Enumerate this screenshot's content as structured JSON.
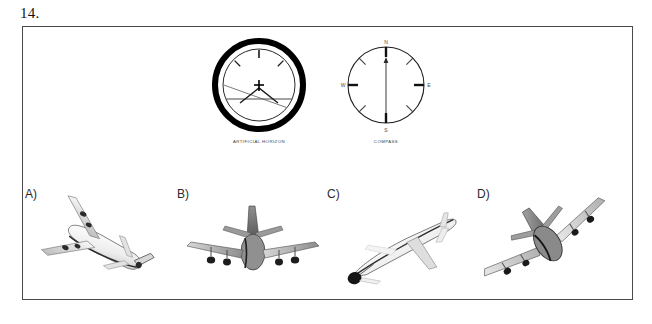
{
  "question": {
    "number": "14.",
    "instruments": [
      {
        "id": "artificial-horizon",
        "caption": "ARTIFICIAL HORIZON",
        "reading": {
          "bank_angle_deg": -20,
          "pitch": "level",
          "description": "Horizon bar tilted, aircraft symbol centred, bank to the left"
        },
        "ticks": [
          "0",
          "-45",
          "+45"
        ]
      },
      {
        "id": "compass",
        "caption": "COMPASS",
        "cardinals": {
          "north": "N",
          "east": "E",
          "south": "S",
          "west": "W"
        },
        "needle_heading": "N",
        "tick_count": 8
      }
    ],
    "options": [
      {
        "letter": "A)",
        "name": "aircraft-top-rear-view-banking",
        "view": "top-rear oblique, four-engine airliner banking"
      },
      {
        "letter": "B)",
        "name": "aircraft-rear-view-level",
        "view": "rear view, wings level, four engines"
      },
      {
        "letter": "C)",
        "name": "aircraft-side-view-climb",
        "view": "side oblique view, nose low / descending"
      },
      {
        "letter": "D)",
        "name": "aircraft-front-view-banked",
        "view": "front view, steeply banked diagonal"
      }
    ]
  },
  "colors": {
    "frame_border": "#4a4a4a",
    "ink": "#141414",
    "dial_line": "#2a2a2a",
    "dial_ring": "#000000",
    "caption": "#3c3c3c",
    "aircraft_light": "#f2f2f2",
    "aircraft_mid": "#b9b9b9",
    "aircraft_dark": "#6e6e6e",
    "background": "#ffffff"
  }
}
